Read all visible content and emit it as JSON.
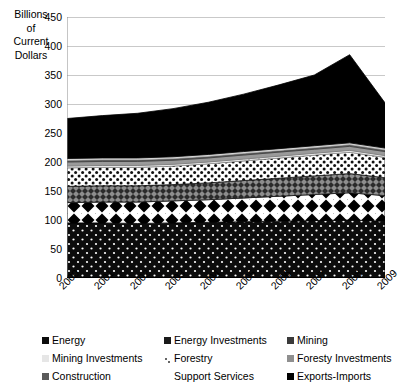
{
  "chart_data": {
    "type": "area",
    "stacked": true,
    "title": "",
    "subtitle": "",
    "xlabel": "",
    "ylabel": "Billions of Current Dollars",
    "ylabel_lines": [
      "Billions",
      "of",
      "Current",
      "Dollars"
    ],
    "grid": true,
    "grid_axis": "y",
    "legend_position": "bottom",
    "legend_columns": 3,
    "ylim": [
      0,
      450
    ],
    "ytick_step": 50,
    "yticks": [
      0,
      50,
      100,
      150,
      200,
      250,
      300,
      350,
      400,
      450
    ],
    "ytick_labels": [
      "0",
      "50",
      "100",
      "150",
      "200",
      "250",
      "300",
      "350",
      "400",
      "450"
    ],
    "x": [
      2000,
      2001,
      2002,
      2003,
      2004,
      2005,
      2006,
      2007,
      2008,
      2009
    ],
    "categories": [
      "2000",
      "2001",
      "2002",
      "2003",
      "2004",
      "2005",
      "2006",
      "2007",
      "2008",
      "2009"
    ],
    "series": [
      {
        "name": "Energy",
        "pattern": "black-with-white-dots",
        "color": "#101010",
        "values": [
          95,
          95,
          94,
          95,
          96,
          97,
          98,
          99,
          100,
          98
        ]
      },
      {
        "name": "Energy Investments",
        "pattern": "white-with-black-diamonds",
        "color": "#ffffff",
        "values": [
          35,
          36,
          37,
          38,
          39,
          41,
          43,
          45,
          47,
          44
        ]
      },
      {
        "name": "Mining",
        "pattern": "dark-gray-checker",
        "color": "#4a4a4a",
        "values": [
          28,
          28,
          28,
          28,
          29,
          30,
          31,
          32,
          33,
          31
        ]
      },
      {
        "name": "Mining Investments",
        "pattern": "white-with-small-black-dots",
        "color": "#f2f2f2",
        "values": [
          32,
          32,
          32,
          32,
          33,
          34,
          35,
          36,
          37,
          35
        ]
      },
      {
        "name": "Forestry",
        "pattern": "white-sparse-dots",
        "color": "#fcfcfc",
        "values": [
          3,
          3,
          3,
          3,
          3,
          3,
          3,
          3,
          3,
          3
        ]
      },
      {
        "name": "Foresty Investments",
        "pattern": "medium-gray",
        "color": "#9a9a9a",
        "values": [
          7,
          7,
          7,
          7,
          7,
          7,
          7,
          7,
          7,
          7
        ]
      },
      {
        "name": "Construction",
        "pattern": "dark-gray-solid",
        "color": "#5a5a5a",
        "values": [
          3,
          3,
          3,
          3,
          3,
          3,
          3,
          3,
          3,
          3
        ]
      },
      {
        "name": "Support Services",
        "pattern": "light-gray",
        "color": "#d8d8d8",
        "values": [
          3,
          3,
          3,
          3,
          3,
          3,
          3,
          3,
          3,
          3
        ]
      },
      {
        "name": "Exports-Imports",
        "pattern": "solid-black",
        "color": "#000000",
        "values": [
          69,
          73,
          77,
          83,
          90,
          99,
          110,
          122,
          152,
          78
        ]
      }
    ],
    "totals": [
      275,
      280,
      284,
      292,
      303,
      317,
      333,
      350,
      385,
      295
    ],
    "annotations": []
  },
  "legend": {
    "items": [
      {
        "label": "Energy",
        "swatch": "black-with-white-dots"
      },
      {
        "label": "Energy Investments",
        "swatch": "white-with-black-diamonds"
      },
      {
        "label": "Mining",
        "swatch": "dark-gray-checker"
      },
      {
        "label": "Mining Investments",
        "swatch": "white-with-small-black-dots"
      },
      {
        "label": "Forestry",
        "swatch": "white-sparse-dots"
      },
      {
        "label": "Foresty Investments",
        "swatch": "medium-gray"
      },
      {
        "label": "Construction",
        "swatch": "dark-gray-solid"
      },
      {
        "label": "Support Services",
        "swatch": "light-gray"
      },
      {
        "label": "Exports-Imports",
        "swatch": "solid-black"
      }
    ]
  }
}
